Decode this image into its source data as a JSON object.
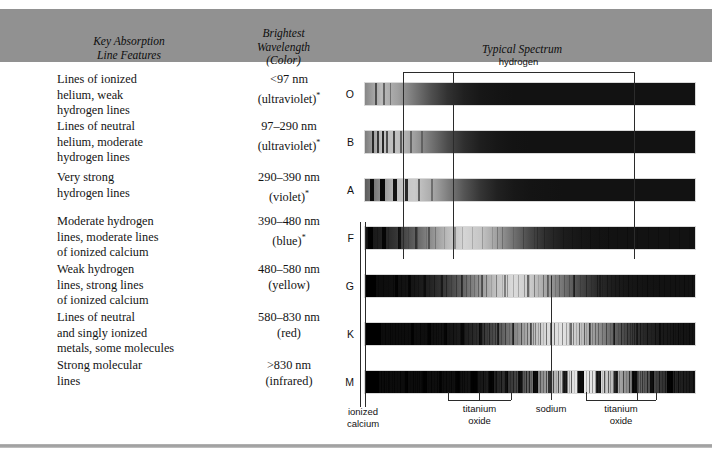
{
  "figure": {
    "type": "stellar-spectral-classification-table",
    "headers": {
      "col1_line1": "Key Absorption",
      "col1_line2": "Line Features",
      "col2_line1": "Brightest",
      "col2_line2": "Wavelength",
      "col2_line3": "(Color)",
      "col3": "Typical Spectrum"
    },
    "rows": [
      {
        "spectral_class": "O",
        "features": "Lines of ionized helium, weak hydrogen lines",
        "feature_lines": [
          "Lines of ionized",
          "helium, weak",
          "hydrogen lines"
        ],
        "wavelength": "<97 nm",
        "color": "(ultraviolet)",
        "color_footnote": "*"
      },
      {
        "spectral_class": "B",
        "features": "Lines of neutral helium, moderate hydrogen lines",
        "feature_lines": [
          "Lines of neutral",
          "helium, moderate",
          "hydrogen lines"
        ],
        "wavelength": "97–290 nm",
        "color": "(ultraviolet)",
        "color_footnote": "*"
      },
      {
        "spectral_class": "A",
        "features": "Very strong hydrogen lines",
        "feature_lines": [
          "Very strong",
          "hydrogen lines"
        ],
        "wavelength": "290–390 nm",
        "color": "(violet)",
        "color_footnote": "*"
      },
      {
        "spectral_class": "F",
        "features": "Moderate hydrogen lines, moderate lines of ionized calcium",
        "feature_lines": [
          "Moderate hydrogen",
          "lines, moderate lines",
          "of ionized calcium"
        ],
        "wavelength": "390–480 nm",
        "color": "(blue)",
        "color_footnote": "*"
      },
      {
        "spectral_class": "G",
        "features": "Weak hydrogen lines, strong lines of ionized calcium",
        "feature_lines": [
          "Weak hydrogen",
          "lines, strong lines",
          "of ionized calcium"
        ],
        "wavelength": "480–580 nm",
        "color": "(yellow)",
        "color_footnote": ""
      },
      {
        "spectral_class": "K",
        "features": "Lines of neutral and singly ionized metals, some molecules",
        "feature_lines": [
          "Lines of neutral",
          "and singly ionized",
          "metals, some molecules"
        ],
        "wavelength": "580–830 nm",
        "color": "(red)",
        "color_footnote": ""
      },
      {
        "spectral_class": "M",
        "features": "Strong molecular lines",
        "feature_lines": [
          "Strong molecular",
          "lines"
        ],
        "wavelength": ">830 nm",
        "color": "(infrared)",
        "color_footnote": ""
      }
    ],
    "annotations": {
      "top": {
        "label": "hydrogen"
      },
      "bottom": [
        {
          "label_line1": "ionized",
          "label_line2": "calcium"
        },
        {
          "label_line1": "titanium",
          "label_line2": "oxide"
        },
        {
          "label_line1": "sodium",
          "label_line2": ""
        },
        {
          "label_line1": "titanium",
          "label_line2": "oxide"
        }
      ]
    },
    "colors": {
      "header_band": "#919191",
      "text": "#141414",
      "annotation_line": "#2b2b2b",
      "frame_rule": "#9a9a9a"
    }
  }
}
